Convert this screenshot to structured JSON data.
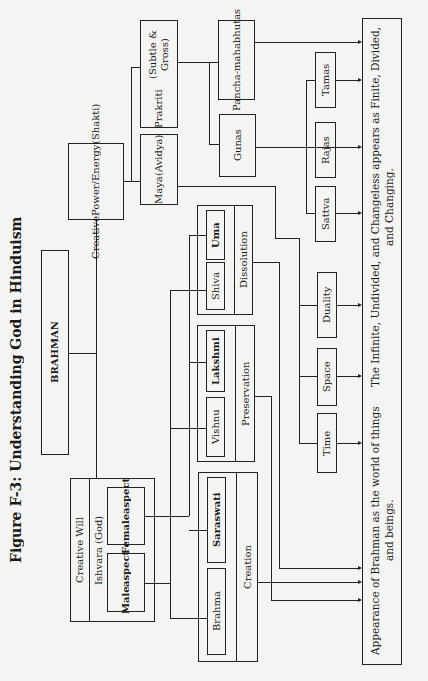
{
  "figure": {
    "title": "Figure F-3: Understanding God in Hinduism"
  },
  "nodes": {
    "brahman": "BRAHMAN",
    "creative_power": [
      "Creative",
      "Power/",
      "Energy",
      "(Shakti)"
    ],
    "maya": [
      "Maya",
      "(Avidya)"
    ],
    "prakriti": [
      "Prakriti",
      "(Subtle & Gross)"
    ],
    "panchamahabhutas": [
      "Pancha-",
      "mahabhutas"
    ],
    "gunas": "Gunas",
    "tamas": "Tamas",
    "rajas": "Rajas",
    "sattva": "Sattva",
    "duality": "Duality",
    "space": "Space",
    "time": "Time",
    "creative_will": {
      "label": "Creative Will",
      "ishvara": "Ishvara (God)",
      "female_aspect": [
        "Female",
        "aspect"
      ],
      "male_aspect": [
        "Male",
        "aspect"
      ]
    },
    "dissolution": {
      "label": "Dissolution",
      "deities": [
        "Shiva",
        "Uma"
      ]
    },
    "preservation": {
      "label": "Preservation",
      "deities": [
        "Vishnu",
        "Lakshmi"
      ]
    },
    "creation": {
      "label": "Creation",
      "deities": [
        "Brahma",
        "Saraswati"
      ]
    },
    "appearance": {
      "line1": "Appearance of Brahman as the world of things and beings.",
      "line2": "The Infinite, Undivided, and Changeless appears as Finite, Divided, and Changing."
    }
  },
  "edges": [
    [
      "BRAHMAN",
      "Creative Power/Energy (Shakti)"
    ],
    [
      "BRAHMAN",
      "Creative Will"
    ],
    [
      "Creative Power/Energy (Shakti)",
      "Maya (Avidya)"
    ],
    [
      "Creative Power/Energy (Shakti)",
      "Prakriti (Subtle & Gross)"
    ],
    [
      "Prakriti (Subtle & Gross)",
      "Pancha-mahabhutas"
    ],
    [
      "Prakriti (Subtle & Gross)",
      "Gunas"
    ],
    [
      "Gunas",
      "Tamas"
    ],
    [
      "Gunas",
      "Rajas"
    ],
    [
      "Gunas",
      "Sattva"
    ],
    [
      "Maya (Avidya)",
      "Duality"
    ],
    [
      "Maya (Avidya)",
      "Space"
    ],
    [
      "Maya (Avidya)",
      "Time"
    ],
    [
      "Male aspect",
      "Brahma"
    ],
    [
      "Male aspect",
      "Vishnu"
    ],
    [
      "Male aspect",
      "Shiva"
    ],
    [
      "Female aspect",
      "Saraswati"
    ],
    [
      "Female aspect",
      "Lakshmi"
    ],
    [
      "Female aspect",
      "Uma"
    ],
    [
      "Creation",
      "Appearance"
    ],
    [
      "Preservation",
      "Appearance"
    ],
    [
      "Dissolution",
      "Appearance"
    ],
    [
      "Pancha-mahabhutas",
      "Appearance"
    ],
    [
      "Tamas",
      "Appearance"
    ],
    [
      "Rajas",
      "Appearance"
    ],
    [
      "Sattva",
      "Appearance"
    ],
    [
      "Duality",
      "Appearance"
    ],
    [
      "Space",
      "Appearance"
    ],
    [
      "Time",
      "Appearance"
    ]
  ],
  "colors": {
    "ink": "#222222",
    "paper": "#f4f4f2",
    "bleed": "#d6d6d2"
  }
}
